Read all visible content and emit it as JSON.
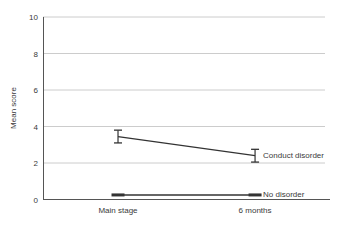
{
  "figure": {
    "background": "#ffffff"
  },
  "colors": {
    "line": "#333333",
    "grid": "#cccccc",
    "axis": "#555555",
    "text": "#3a3a3a"
  },
  "chart_data": {
    "type": "line",
    "title": "",
    "xlabel": "",
    "ylabel": "Mean score",
    "categories": [
      "Main stage",
      "6 months"
    ],
    "ylim": [
      0,
      10
    ],
    "yticks": [
      0,
      2,
      4,
      6,
      8,
      10
    ],
    "grid": true,
    "legend_position": "end-of-line",
    "series": [
      {
        "name": "Conduct disorder",
        "values": [
          3.45,
          2.4
        ],
        "error": [
          0.35,
          0.35
        ],
        "marker": "error-bar"
      },
      {
        "name": "No disorder",
        "values": [
          0.25,
          0.25
        ],
        "error": [
          0.08,
          0.08
        ],
        "marker": "thick-dash"
      }
    ]
  }
}
